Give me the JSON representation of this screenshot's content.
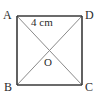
{
  "figure": {
    "kind": "square-with-diagonals",
    "background_color": "#ffffff",
    "edge_color": "#3a3a3a",
    "diagonal_color": "#8a8a8a",
    "text_color": "#2b2b2b",
    "square": {
      "left": 17,
      "top": 16,
      "right": 82,
      "bottom": 85
    },
    "center": {
      "x": 49.5,
      "y": 50.5
    },
    "vertices": [
      {
        "id": "A",
        "label": "A",
        "position": "top-left",
        "x": 17,
        "y": 16
      },
      {
        "id": "D",
        "label": "D",
        "position": "top-right",
        "x": 82,
        "y": 16
      },
      {
        "id": "B",
        "label": "B",
        "position": "bottom-left",
        "x": 17,
        "y": 85
      },
      {
        "id": "C",
        "label": "C",
        "position": "bottom-right",
        "x": 82,
        "y": 85
      }
    ],
    "center_point": {
      "id": "O",
      "label": "O"
    },
    "diagonals": [
      {
        "id": "AC",
        "from": "A",
        "to": "C"
      },
      {
        "id": "BD",
        "from": "B",
        "to": "D"
      }
    ],
    "edges": [
      {
        "id": "AD",
        "from": "A",
        "to": "D"
      },
      {
        "id": "DC",
        "from": "D",
        "to": "C"
      },
      {
        "id": "CB",
        "from": "C",
        "to": "B"
      },
      {
        "id": "BA",
        "from": "B",
        "to": "A"
      }
    ],
    "measurement": {
      "value": "4 cm",
      "number": 4,
      "unit": "cm",
      "applies_to": "AO"
    }
  }
}
